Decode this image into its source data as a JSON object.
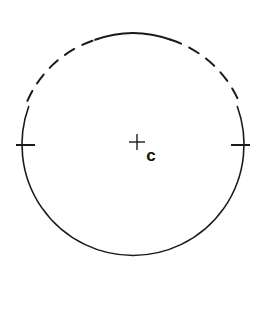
{
  "figure": {
    "background_color": "#ffffff",
    "stroke_color": "#1a1a1a",
    "width": 266,
    "height": 321
  },
  "circle": {
    "center_x": 133,
    "center_y": 144,
    "radius": 111,
    "stroke_width": 1.6,
    "description": "circle outline, solid on lower portion, dashed across the top"
  },
  "arcs": [
    {
      "name": "solid-lower-arc",
      "style": "solid",
      "start_angle_deg": 160,
      "end_angle_deg": 380,
      "note": "continuous arc from upper-left around the bottom to upper-right"
    },
    {
      "name": "dashed-top-arc-left",
      "style": "dashed",
      "start_angle_deg": 198,
      "end_angle_deg": 250,
      "dash_pattern": "11 9"
    },
    {
      "name": "solid-apex-arc",
      "style": "solid",
      "start_angle_deg": 250,
      "end_angle_deg": 290,
      "note": "short continuous segment at the very top of the circle"
    },
    {
      "name": "dashed-top-arc-right",
      "style": "dashed",
      "start_angle_deg": 290,
      "end_angle_deg": 342,
      "dash_pattern": "11 9"
    }
  ],
  "ticks": [
    {
      "name": "left-diameter-tick",
      "position": "west",
      "x": 16,
      "y": 145,
      "length": 19,
      "orientation": "horizontal",
      "stroke_width": 2.0
    },
    {
      "name": "right-diameter-tick",
      "position": "east",
      "x": 232,
      "y": 145,
      "length": 19,
      "orientation": "horizontal",
      "stroke_width": 2.0
    }
  ],
  "center_mark": {
    "name": "center-cross",
    "symbol": "plus",
    "x": 137,
    "y": 142,
    "arm_length": 8,
    "stroke_width": 1.4
  },
  "labels": [
    {
      "name": "center-label",
      "text": "c",
      "x": 151,
      "y": 157,
      "font_size": 17,
      "weight": "bold"
    }
  ]
}
